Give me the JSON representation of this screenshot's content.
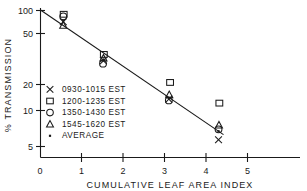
{
  "chart_data": {
    "type": "scatter",
    "title": "",
    "xlabel": "CUMULATIVE LEAF AREA INDEX",
    "ylabel": "% TRANSMISSION",
    "yscale": "log",
    "xlim": [
      0,
      5.6
    ],
    "ylim": [
      4.4,
      105
    ],
    "grid": false,
    "xticks": [
      0,
      1,
      2,
      3,
      4,
      5
    ],
    "xticklabels": [
      "0",
      "1",
      "2",
      "3",
      "4",
      "5"
    ],
    "yticks": [
      100,
      50,
      20,
      10,
      5
    ],
    "yticklabels": [
      "100",
      "50",
      "20",
      "10",
      "5"
    ],
    "legend_position": "center-left",
    "series": [
      {
        "name": "0930-1015 EST",
        "marker": "x-marker",
        "points": [
          {
            "x": 0.55,
            "y": 78
          },
          {
            "x": 1.52,
            "y": 33
          },
          {
            "x": 3.1,
            "y": 14.2
          },
          {
            "x": 4.3,
            "y": 5.8
          }
        ]
      },
      {
        "name": "1200-1235 EST",
        "marker": "square-marker",
        "points": [
          {
            "x": 0.56,
            "y": 92
          },
          {
            "x": 1.53,
            "y": 38
          },
          {
            "x": 3.13,
            "y": 20.5
          },
          {
            "x": 4.32,
            "y": 13.0
          }
        ]
      },
      {
        "name": "1350-1430 EST",
        "marker": "circle-marker",
        "points": [
          {
            "x": 0.55,
            "y": 88
          },
          {
            "x": 1.51,
            "y": 31
          },
          {
            "x": 3.1,
            "y": 13.8
          },
          {
            "x": 4.3,
            "y": 7.3
          }
        ]
      },
      {
        "name": "1545-1620 EST",
        "marker": "triangle-marker",
        "points": [
          {
            "x": 0.55,
            "y": 72
          },
          {
            "x": 1.52,
            "y": 35
          },
          {
            "x": 3.11,
            "y": 15.6
          },
          {
            "x": 4.31,
            "y": 8.0
          }
        ]
      },
      {
        "name": "AVERAGE",
        "marker": "dot-marker",
        "points": [
          {
            "x": 0.55,
            "y": 80
          },
          {
            "x": 1.52,
            "y": 34
          },
          {
            "x": 3.11,
            "y": 14.5
          },
          {
            "x": 4.3,
            "y": 7.0
          }
        ]
      }
    ],
    "fit_line": {
      "name": "regression-line",
      "x_start": 0.0,
      "y_start": 101,
      "x_end": 4.42,
      "y_end": 6.5
    },
    "legend": [
      {
        "marker": "x-marker",
        "label": "0930-1015  EST"
      },
      {
        "marker": "square-marker",
        "label": "1200-1235  EST"
      },
      {
        "marker": "circle-marker",
        "label": "1350-1430  EST"
      },
      {
        "marker": "triangle-marker",
        "label": "1545-1620  EST"
      },
      {
        "marker": "dot-marker",
        "label": "AVERAGE"
      }
    ],
    "colors": {
      "ink": "#1a1a1a",
      "background": "#ffffff"
    }
  }
}
